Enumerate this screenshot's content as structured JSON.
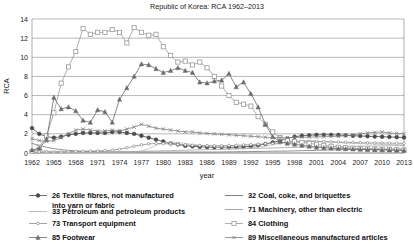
{
  "chart_data": {
    "type": "line",
    "title": "Republic of Korea: RCA 1962–2013",
    "xlabel": "year",
    "ylabel": "RCA",
    "xlim": [
      1962,
      2013
    ],
    "ylim": [
      0,
      14
    ],
    "yticks": [
      0,
      2,
      4,
      6,
      8,
      10,
      12,
      14
    ],
    "xticks": [
      1962,
      1965,
      1968,
      1971,
      1974,
      1977,
      1980,
      1983,
      1986,
      1989,
      1992,
      1995,
      1998,
      2001,
      2004,
      2007,
      2010,
      2013
    ],
    "grid": true,
    "legend_position": "bottom",
    "x": [
      1962,
      1963,
      1964,
      1965,
      1966,
      1967,
      1968,
      1969,
      1970,
      1971,
      1972,
      1973,
      1974,
      1975,
      1976,
      1977,
      1978,
      1979,
      1980,
      1981,
      1982,
      1983,
      1984,
      1985,
      1986,
      1987,
      1988,
      1989,
      1990,
      1991,
      1992,
      1993,
      1994,
      1995,
      1996,
      1997,
      1998,
      1999,
      2000,
      2001,
      2002,
      2003,
      2004,
      2005,
      2006,
      2007,
      2008,
      2009,
      2010,
      2011,
      2012,
      2013
    ],
    "series": [
      {
        "name": "26 Textile fibres, not manufactured into yarn or fabric",
        "code": "26",
        "marker": "filled-circle",
        "color": "#4a4a4a",
        "values": [
          2.6,
          2.0,
          1.7,
          1.6,
          1.7,
          1.9,
          2.0,
          2.1,
          2.1,
          2.1,
          2.1,
          2.2,
          2.2,
          2.1,
          2.0,
          1.8,
          1.6,
          1.4,
          1.2,
          1.0,
          0.9,
          0.75,
          0.7,
          0.65,
          0.62,
          0.6,
          0.6,
          0.6,
          0.62,
          0.65,
          0.7,
          0.8,
          0.95,
          1.1,
          1.3,
          1.5,
          1.7,
          1.8,
          1.85,
          1.9,
          1.9,
          1.9,
          1.88,
          1.85,
          1.8,
          1.78,
          1.75,
          1.72,
          1.7,
          1.68,
          1.65,
          1.62
        ]
      },
      {
        "name": "32 Coal, coke, and briquettes",
        "code": "32",
        "marker": "none",
        "color": "#6f6f6f",
        "values": [
          1.0,
          0.8,
          0.6,
          0.45,
          0.35,
          0.28,
          0.22,
          0.18,
          0.15,
          0.13,
          0.12,
          0.11,
          0.1,
          0.1,
          0.1,
          0.1,
          0.1,
          0.1,
          0.1,
          0.1,
          0.1,
          0.1,
          0.1,
          0.1,
          0.1,
          0.1,
          0.11,
          0.12,
          0.13,
          0.14,
          0.15,
          0.16,
          0.17,
          0.18,
          0.19,
          0.2,
          0.22,
          0.24,
          0.26,
          0.28,
          0.3,
          0.32,
          0.34,
          0.36,
          0.38,
          0.4,
          0.42,
          0.42,
          0.42,
          0.42,
          0.42,
          0.42
        ]
      },
      {
        "name": "33 Petroleum and petroleum products",
        "code": "33",
        "marker": "none",
        "color": "#b8b8b8",
        "values": [
          0.05,
          0.05,
          0.05,
          0.05,
          0.05,
          0.05,
          0.06,
          0.06,
          0.07,
          0.07,
          0.08,
          0.08,
          0.09,
          0.1,
          0.12,
          0.2,
          0.45,
          0.8,
          1.05,
          1.15,
          1.1,
          1.0,
          0.9,
          0.8,
          0.7,
          0.62,
          0.55,
          0.5,
          0.48,
          0.5,
          0.55,
          0.62,
          0.72,
          0.85,
          1.0,
          1.15,
          1.25,
          1.3,
          1.3,
          1.25,
          1.2,
          1.15,
          1.1,
          1.05,
          1.0,
          0.98,
          0.95,
          0.92,
          0.9,
          0.88,
          0.86,
          0.85
        ]
      },
      {
        "name": "71 Machinery, other than electric",
        "code": "71",
        "marker": "none",
        "color": "#9d9d9d",
        "values": [
          0.3,
          0.25,
          0.2,
          0.16,
          0.14,
          0.12,
          0.11,
          0.1,
          0.1,
          0.1,
          0.11,
          0.12,
          0.13,
          0.14,
          0.15,
          0.17,
          0.19,
          0.21,
          0.23,
          0.25,
          0.27,
          0.29,
          0.31,
          0.33,
          0.35,
          0.37,
          0.39,
          0.41,
          0.43,
          0.45,
          0.47,
          0.49,
          0.51,
          0.53,
          0.55,
          0.57,
          0.59,
          0.61,
          0.63,
          0.65,
          0.66,
          0.67,
          0.68,
          0.69,
          0.7,
          0.71,
          0.72,
          0.73,
          0.74,
          0.75,
          0.76,
          0.77
        ]
      },
      {
        "name": "73 Transport equipment",
        "code": "73",
        "marker": "open-circle-small",
        "color": "#8c8c8c",
        "values": [
          0.1,
          0.1,
          0.1,
          0.1,
          0.1,
          0.12,
          0.15,
          0.18,
          0.2,
          0.22,
          0.25,
          0.3,
          0.4,
          0.55,
          0.7,
          0.85,
          0.95,
          1.0,
          0.98,
          0.95,
          0.9,
          0.85,
          0.8,
          0.78,
          0.76,
          0.75,
          0.76,
          0.78,
          0.8,
          0.84,
          0.88,
          0.92,
          0.96,
          1.0,
          1.05,
          1.1,
          1.15,
          1.18,
          1.2,
          1.2,
          1.18,
          1.16,
          1.14,
          1.12,
          1.1,
          1.08,
          1.06,
          1.05,
          1.04,
          1.03,
          1.02,
          1.0
        ]
      },
      {
        "name": "84 Clothing",
        "code": "84",
        "marker": "open-square",
        "color": "#999999",
        "values": [
          0.15,
          0.6,
          1.8,
          4.2,
          7.3,
          9.0,
          10.6,
          13.0,
          12.4,
          12.6,
          12.6,
          12.9,
          12.6,
          11.5,
          13.1,
          12.6,
          12.3,
          12.4,
          11.1,
          10.2,
          9.5,
          9.6,
          9.2,
          9.5,
          8.9,
          8.0,
          7.0,
          6.0,
          5.3,
          5.1,
          4.9,
          3.8,
          3.0,
          2.2,
          1.6,
          1.3,
          1.2,
          1.1,
          1.0,
          0.9,
          0.8,
          0.7,
          0.6,
          0.55,
          0.5,
          0.45,
          0.42,
          0.4,
          0.38,
          0.36,
          0.34,
          0.32
        ]
      },
      {
        "name": "85 Footwear",
        "code": "85",
        "marker": "filled-triangle",
        "color": "#6a6a6a",
        "values": [
          0.3,
          0.5,
          1.4,
          5.8,
          4.6,
          4.8,
          4.4,
          3.4,
          3.2,
          4.5,
          4.3,
          3.2,
          5.6,
          6.8,
          8.0,
          9.3,
          9.2,
          8.8,
          8.4,
          8.6,
          8.9,
          8.6,
          8.4,
          7.4,
          7.3,
          7.5,
          7.6,
          8.3,
          6.9,
          7.4,
          6.2,
          4.8,
          3.0,
          1.7,
          1.2,
          1.0,
          0.9,
          0.8,
          0.7,
          0.6,
          0.55,
          0.5,
          0.46,
          0.43,
          0.4,
          0.38,
          0.36,
          0.34,
          0.32,
          0.3,
          0.28,
          0.26
        ]
      },
      {
        "name": "89 Miscellaneous manufactured articles",
        "code": "89",
        "marker": "cross",
        "color": "#7d7d7d",
        "values": [
          1.5,
          1.3,
          1.2,
          1.3,
          1.6,
          2.0,
          2.4,
          2.5,
          2.4,
          2.3,
          2.3,
          2.4,
          2.3,
          2.5,
          2.7,
          3.0,
          2.8,
          2.6,
          2.5,
          2.4,
          2.3,
          2.2,
          2.2,
          2.1,
          2.05,
          2.0,
          1.95,
          1.9,
          1.85,
          1.8,
          1.75,
          1.7,
          1.65,
          1.6,
          1.6,
          1.6,
          1.62,
          1.64,
          1.66,
          1.68,
          1.7,
          1.72,
          1.75,
          1.8,
          1.9,
          2.0,
          2.1,
          2.15,
          2.2,
          2.1,
          2.05,
          2.0
        ]
      }
    ]
  },
  "legend": {
    "items": [
      {
        "label": "26 Textile fibres, not manufactured",
        "label2": "into yarn or fabric",
        "marker": "filled-circle"
      },
      {
        "label": "32 Coal, coke, and briquettes",
        "label2": "",
        "marker": "none"
      },
      {
        "label": "33 Petroleum and petroleum products",
        "label2": "",
        "marker": "none"
      },
      {
        "label": "71 Machinery, other than electric",
        "label2": "",
        "marker": "none"
      },
      {
        "label": "73 Transport equipment",
        "label2": "",
        "marker": "open-circle-small"
      },
      {
        "label": "84 Clothing",
        "label2": "",
        "marker": "open-square"
      },
      {
        "label": "85 Footwear",
        "label2": "",
        "marker": "filled-triangle"
      },
      {
        "label": "89 Miscellaneous manufactured articles",
        "label2": "",
        "marker": "cross"
      }
    ]
  }
}
